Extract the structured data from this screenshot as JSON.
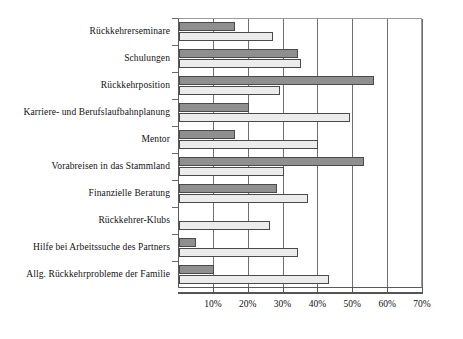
{
  "chart_data": {
    "type": "bar",
    "orientation": "horizontal",
    "title": "",
    "subtitle": "",
    "xlabel": "",
    "ylabel": "",
    "xlim": [
      0,
      70
    ],
    "xtick_labels": [
      "10%",
      "20%",
      "30%",
      "40%",
      "50%",
      "60%",
      "70%"
    ],
    "xtick_values": [
      10,
      20,
      30,
      40,
      50,
      60,
      70
    ],
    "grid": true,
    "grid_axis": "x",
    "legend": false,
    "legend_position": "none",
    "categories": [
      "Rückkehrerseminare",
      "Schulungen",
      "Rückkehrposition",
      "Karriere- und Berufslaufbahnplanung",
      "Mentor",
      "Vorabreisen in das Stammland",
      "Finanzielle Beratung",
      "Rückkehrer-Klubs",
      "Hilfe bei Arbeitssuche des Partners",
      "Allg. Rückkehrprobleme der Familie"
    ],
    "series": [
      {
        "name": "series-a",
        "color": "#8f8f8f",
        "values": [
          16,
          34,
          56,
          20,
          16,
          53,
          28,
          0,
          5,
          10
        ]
      },
      {
        "name": "series-b",
        "color": "#ececec",
        "values": [
          27,
          35,
          29,
          49,
          40,
          30,
          37,
          26,
          34,
          43
        ]
      }
    ]
  },
  "axis": {
    "x_unit": "%",
    "x_max_label": "70%"
  }
}
